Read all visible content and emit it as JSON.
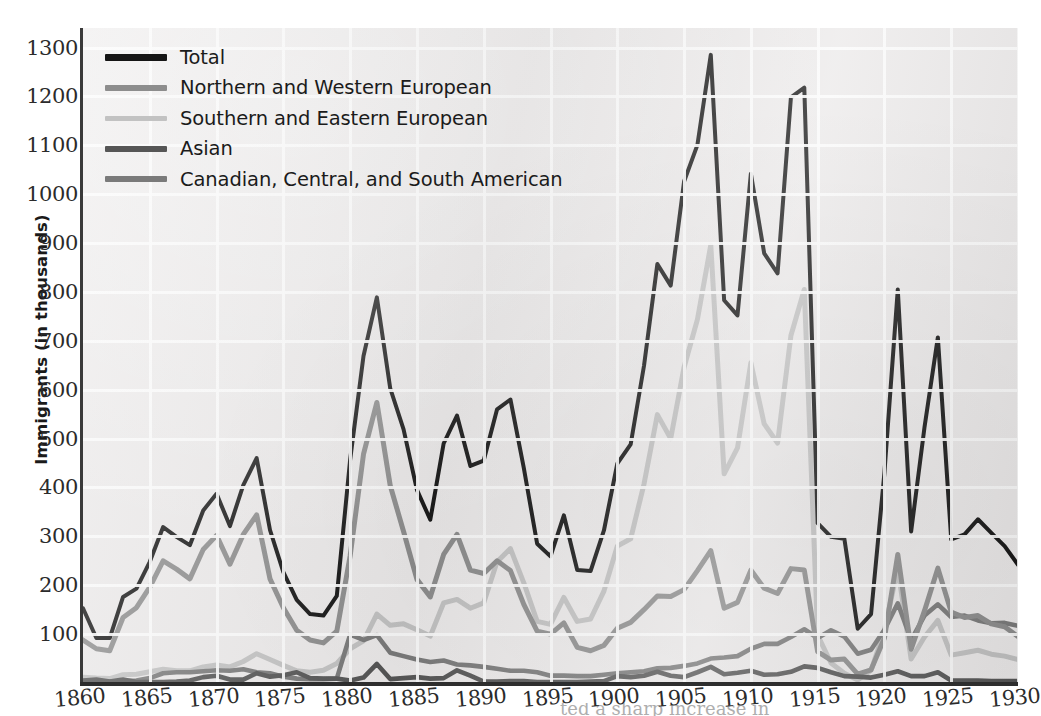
{
  "axes": {
    "y_title": "Immigrants (in thousands)",
    "y_ticks": [
      "100",
      "200",
      "300",
      "400",
      "500",
      "600",
      "700",
      "800",
      "900",
      "1000",
      "1100",
      "1200",
      "1300"
    ],
    "x_ticks": [
      "1860",
      "1865",
      "1870",
      "1875",
      "1880",
      "1885",
      "1890",
      "1895",
      "1900",
      "1905",
      "1910",
      "1915",
      "1920",
      "1925",
      "1930"
    ]
  },
  "legend": {
    "items": [
      {
        "label": "Total",
        "color": "#151515"
      },
      {
        "label": "Northern and Western European",
        "color": "#8d8d8d"
      },
      {
        "label": "Southern and Eastern European",
        "color": "#c2c2c2"
      },
      {
        "label": "Asian",
        "color": "#565656"
      },
      {
        "label": "Canadian, Central, and South American",
        "color": "#7a7a7a"
      }
    ]
  },
  "caption": {
    "fragment": "ted a sharp increase in"
  },
  "colors": {
    "plot_background": "#eceaea",
    "gridline": "#fbfbfb",
    "axis": "#2e2e2e",
    "tick_text": "#2b2b2b"
  },
  "chart_data": {
    "type": "line",
    "title": "",
    "xlabel": "",
    "ylabel": "Immigrants (in thousands)",
    "xlim": [
      1860,
      1930
    ],
    "ylim": [
      0,
      1340
    ],
    "grid": true,
    "legend_position": "top-left",
    "x": [
      1860,
      1861,
      1862,
      1863,
      1864,
      1865,
      1866,
      1867,
      1868,
      1869,
      1870,
      1871,
      1872,
      1873,
      1874,
      1875,
      1876,
      1877,
      1878,
      1879,
      1880,
      1881,
      1882,
      1883,
      1884,
      1885,
      1886,
      1887,
      1888,
      1889,
      1890,
      1891,
      1892,
      1893,
      1894,
      1895,
      1896,
      1897,
      1898,
      1899,
      1900,
      1901,
      1902,
      1903,
      1904,
      1905,
      1906,
      1907,
      1908,
      1909,
      1910,
      1911,
      1912,
      1913,
      1914,
      1915,
      1916,
      1917,
      1918,
      1919,
      1920,
      1921,
      1922,
      1923,
      1924,
      1925,
      1926,
      1927,
      1928,
      1929,
      1930
    ],
    "series": [
      {
        "name": "Total",
        "color": "#151515",
        "values": [
          153,
          92,
          92,
          176,
          193,
          248,
          319,
          299,
          282,
          353,
          387,
          321,
          405,
          460,
          313,
          227,
          170,
          141,
          138,
          178,
          457,
          669,
          789,
          603,
          519,
          395,
          334,
          490,
          547,
          444,
          455,
          560,
          580,
          440,
          285,
          259,
          343,
          231,
          229,
          312,
          449,
          488,
          649,
          857,
          813,
          1026,
          1101,
          1285,
          783,
          752,
          1042,
          879,
          838,
          1198,
          1218,
          327,
          299,
          295,
          111,
          141,
          430,
          805,
          310,
          523,
          707,
          294,
          304,
          335,
          307,
          280,
          242
        ]
      },
      {
        "name": "Northern and Western European",
        "color": "#8d8d8d",
        "values": [
          88,
          70,
          66,
          134,
          154,
          196,
          250,
          233,
          213,
          273,
          302,
          243,
          304,
          344,
          213,
          154,
          108,
          88,
          82,
          106,
          260,
          468,
          574,
          404,
          310,
          212,
          176,
          263,
          304,
          231,
          224,
          250,
          230,
          161,
          106,
          100,
          123,
          73,
          66,
          77,
          112,
          124,
          150,
          178,
          177,
          191,
          230,
          271,
          153,
          165,
          231,
          194,
          183,
          234,
          231,
          64,
          47,
          49,
          18,
          27,
          92,
          263,
          69,
          148,
          235,
          145,
          134,
          138,
          121,
          115,
          95
        ]
      },
      {
        "name": "Southern and Eastern European",
        "color": "#c2c2c2",
        "values": [
          12,
          10,
          9,
          17,
          18,
          23,
          28,
          25,
          25,
          33,
          37,
          33,
          44,
          60,
          48,
          36,
          25,
          22,
          26,
          40,
          70,
          86,
          141,
          118,
          121,
          109,
          96,
          164,
          171,
          153,
          164,
          248,
          275,
          205,
          126,
          120,
          175,
          126,
          131,
          188,
          280,
          295,
          407,
          549,
          500,
          646,
          744,
          896,
          428,
          481,
          655,
          530,
          491,
          711,
          805,
          98,
          41,
          20,
          6,
          26,
          108,
          235,
          49,
          94,
          128,
          57,
          62,
          67,
          59,
          55,
          48
        ]
      },
      {
        "name": "Asian",
        "color": "#565656",
        "values": [
          5,
          7,
          3,
          7,
          2,
          2,
          2,
          3,
          5,
          12,
          15,
          7,
          7,
          20,
          13,
          16,
          22,
          10,
          9,
          9,
          5,
          11,
          39,
          8,
          10,
          12,
          9,
          10,
          26,
          15,
          3,
          3,
          4,
          4,
          2,
          2,
          2,
          2,
          3,
          4,
          14,
          12,
          15,
          23,
          15,
          12,
          22,
          33,
          18,
          21,
          25,
          17,
          18,
          23,
          34,
          31,
          22,
          14,
          13,
          11,
          17,
          24,
          14,
          14,
          22,
          5,
          5,
          5,
          4,
          4,
          4
        ]
      },
      {
        "name": "Canadian, Central, and South American",
        "color": "#7a7a7a",
        "values": [
          4,
          3,
          3,
          4,
          5,
          10,
          20,
          22,
          22,
          24,
          26,
          25,
          28,
          22,
          20,
          13,
          9,
          8,
          8,
          9,
          99,
          88,
          98,
          62,
          55,
          48,
          43,
          46,
          38,
          36,
          33,
          29,
          25,
          25,
          22,
          15,
          15,
          14,
          14,
          17,
          20,
          22,
          24,
          30,
          31,
          35,
          40,
          50,
          52,
          55,
          70,
          80,
          80,
          94,
          110,
          92,
          108,
          95,
          60,
          68,
          109,
          163,
          88,
          138,
          161,
          135,
          138,
          128,
          122,
          123,
          117
        ]
      }
    ]
  }
}
